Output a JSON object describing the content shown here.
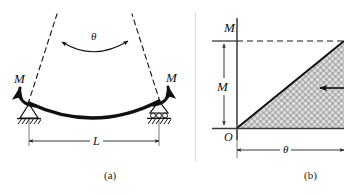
{
  "figure": {
    "background_color": "#ffffff",
    "ink_color": "#101010",
    "dimension_line_color": "#4a4a4a",
    "shade_fill_color": "#b9b9b9",
    "divider_color": "#d9d9d9",
    "panels": [
      {
        "id": "a",
        "caption": "(a)",
        "description": "Simply supported beam bent by equal end moments",
        "labels": {
          "moment_left": "M",
          "moment_right": "M",
          "angle": "θ",
          "span": "L"
        },
        "supports": {
          "left": "pin-support",
          "right": "roller-support"
        }
      },
      {
        "id": "b",
        "caption": "(b)",
        "description": "Moment versus rotation diagram with shaded triangular work area",
        "labels": {
          "axis_vertical": "M",
          "axis_horizontal": "θ",
          "origin": "O",
          "ordinate": "M",
          "abscissa": "θ"
        }
      }
    ]
  }
}
